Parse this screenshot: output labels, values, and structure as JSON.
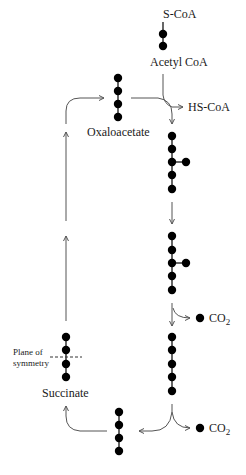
{
  "diagram": {
    "labels": {
      "s_coa": "S-CoA",
      "acetyl_coa": "Acetyl CoA",
      "hs_coa": "HS-CoA",
      "oxaloacetate": "Oxaloacetate",
      "co2_first": "CO",
      "co2_first_sub": "2",
      "co2_second": "CO",
      "co2_second_sub": "2",
      "plane_line1": "Plane of",
      "plane_line2": "symmetry",
      "succinate": "Succinate"
    },
    "molecules": [
      {
        "name": "acetyl-coa",
        "carbons": 2
      },
      {
        "name": "oxaloacetate",
        "carbons": 4
      },
      {
        "name": "citrate",
        "carbons": 6,
        "branched": true
      },
      {
        "name": "isocitrate",
        "carbons": 6,
        "branched": true
      },
      {
        "name": "alpha-ketoglutarate",
        "carbons": 5
      },
      {
        "name": "succinyl-coa",
        "carbons": 4
      },
      {
        "name": "succinate",
        "carbons": 4
      }
    ],
    "colors": {
      "atom": "#000000",
      "arrow": "#555555",
      "text": "#1a1a1a"
    }
  }
}
